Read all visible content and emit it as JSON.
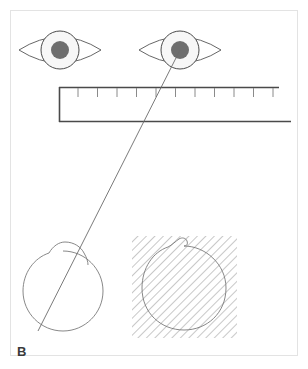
{
  "figure": {
    "panel_label": "B",
    "canvas": {
      "width": 308,
      "height": 369
    },
    "background_color": "#ffffff",
    "frame_color": "#e3e3e3",
    "ink_color": "#6b6b6b"
  },
  "eyes": [
    {
      "name": "left-eye",
      "center_x": 60,
      "center_y": 50,
      "lid_half_width": 41,
      "lid_half_height": 19,
      "iris_radius": 19,
      "pupil_radius": 9,
      "iris_fill": "#f7f7f7",
      "pupil_fill": "#6e6e6e"
    },
    {
      "name": "right-eye",
      "center_x": 180,
      "center_y": 50,
      "lid_half_width": 41,
      "lid_half_height": 19,
      "iris_radius": 19,
      "pupil_radius": 9,
      "iris_fill": "#f7f7f7",
      "pupil_fill": "#6e6e6e"
    }
  ],
  "ruler": {
    "name": "ruler",
    "left_x": 59,
    "right_x_top": 279,
    "right_x_bottom": 291,
    "top_y": 87,
    "bottom_y": 122,
    "tick_count": 11,
    "tick_length": 9,
    "tick_spacing": 19.5,
    "tick_start_x": 78,
    "line_color": "#4a4a4a",
    "tick_color": "#8a8a8a"
  },
  "ray": {
    "name": "sight-ray",
    "from_x": 180,
    "from_y": 50,
    "to_x": 38,
    "to_y": 331,
    "color": "#6b6b6b"
  },
  "globes": [
    {
      "name": "left-globe",
      "center_x": 63,
      "center_y": 291,
      "radius": 40,
      "cornea_bump_top_y": 240,
      "has_ray_through": true
    },
    {
      "name": "right-globe",
      "center_x": 184,
      "center_y": 288,
      "radius": 42,
      "cornea_bump_top_y": 240,
      "has_ray_through": false
    }
  ],
  "hatched_region": {
    "name": "hatched-square",
    "x": 132,
    "y": 236,
    "width": 105,
    "height": 102,
    "hatch_direction": "backslash",
    "hatch_spacing": 6,
    "hatch_color": "#9a9a9a"
  }
}
